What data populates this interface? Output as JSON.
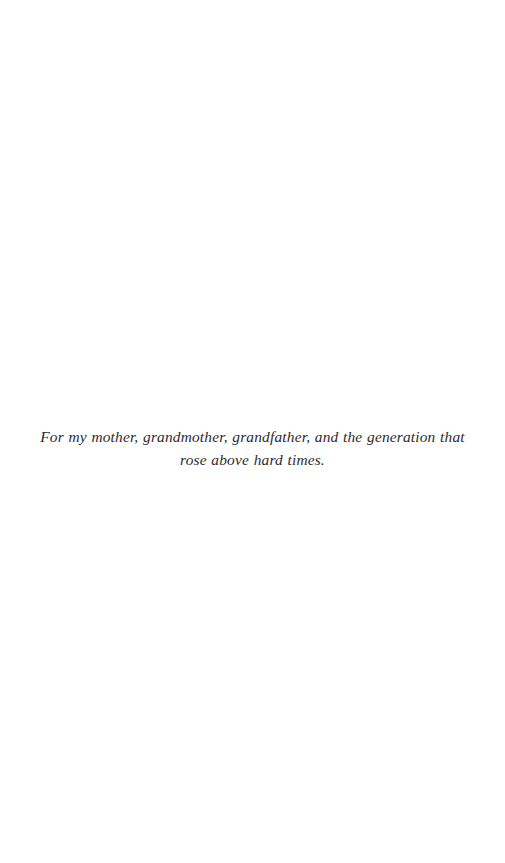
{
  "page": {
    "background_color": "#ffffff",
    "width": 505,
    "height": 863,
    "type": "book-dedication-page"
  },
  "dedication": {
    "text": "For my mother, grandmother, grandfather, and the generation that rose above hard times.",
    "line_1": "For my mother, grandmother, grandfather, and the generation that rose above",
    "line_2": "hard times.",
    "text_color": "#2b2b30",
    "style": "italic",
    "alignment": "center"
  },
  "folio": {
    "visible": false,
    "page_number": ""
  },
  "running_head": {
    "visible": false,
    "text": ""
  }
}
